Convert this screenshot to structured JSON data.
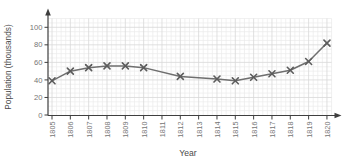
{
  "page": {
    "background": "#ffffff"
  },
  "chart_data": {
    "type": "line",
    "title": "",
    "xlabel": "Year",
    "ylabel": "Population (thousands)",
    "x_ticks": [
      "1805",
      "1806",
      "1807",
      "1808",
      "1809",
      "1810",
      "1811",
      "1812",
      "1813",
      "1814",
      "1815",
      "1816",
      "1817",
      "1818",
      "1819",
      "1820"
    ],
    "y_ticks": [
      0,
      20,
      40,
      60,
      80,
      100
    ],
    "xlim": [
      1805,
      1820
    ],
    "ylim": [
      0,
      100
    ],
    "grid": {
      "major": true,
      "minor": true,
      "minor_y_step_units": 5,
      "minor_x_divisions_per_year": 4
    },
    "legend_position": "none",
    "marker_style": "x",
    "series": [
      {
        "name": "Population",
        "points": [
          {
            "x": 1805,
            "y": 39
          },
          {
            "x": 1806,
            "y": 50
          },
          {
            "x": 1807,
            "y": 54
          },
          {
            "x": 1808,
            "y": 56
          },
          {
            "x": 1809,
            "y": 56
          },
          {
            "x": 1810,
            "y": 54
          },
          {
            "x": 1812,
            "y": 44
          },
          {
            "x": 1814,
            "y": 41
          },
          {
            "x": 1815,
            "y": 39
          },
          {
            "x": 1816,
            "y": 43
          },
          {
            "x": 1817,
            "y": 47
          },
          {
            "x": 1818,
            "y": 51
          },
          {
            "x": 1819,
            "y": 61
          },
          {
            "x": 1820,
            "y": 82
          }
        ]
      }
    ],
    "colors": {
      "line": "#6f6f6f",
      "marker": "#5c5c5c",
      "axis": "#3f3f3f",
      "grid_minor": "#ebebeb",
      "grid_major": "#d8d8d8",
      "tick_label": "#757575",
      "axis_title": "#4a4a4a",
      "background": "#ffffff"
    }
  }
}
